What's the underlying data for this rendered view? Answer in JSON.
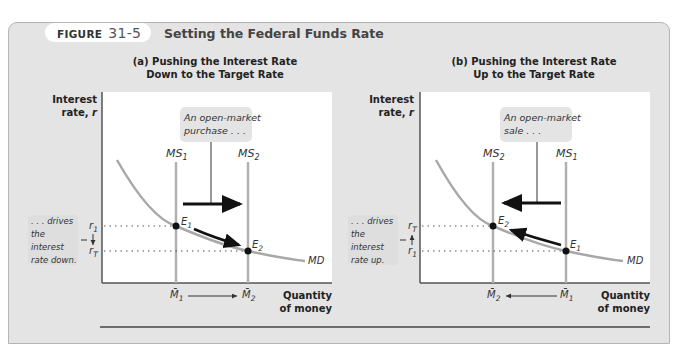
{
  "figure": {
    "label": "FIGURE",
    "number": "31-5",
    "title": "Setting the Federal Funds Rate"
  },
  "panels": [
    {
      "id": "a",
      "title_line1": "(a) Pushing the Interest Rate",
      "title_line2": "Down to the Target Rate",
      "y_axis_label_line1": "Interest",
      "y_axis_label_line2": "rate, r",
      "x_axis_label_line1": "Quantity",
      "x_axis_label_line2": "of money",
      "callout_line1": "An open-market",
      "callout_line2": "purchase . . .",
      "note_lines": [
        ". . . drives",
        "the",
        "interest",
        "rate down."
      ],
      "supply_left": "MS1",
      "supply_right": "MS2",
      "rate_top": "r1",
      "rate_bottom": "rT",
      "equilibrium_start": "E1",
      "equilibrium_end": "E2",
      "demand_label": "MD",
      "money_left": "M̄1",
      "money_right": "M̄2",
      "shift_direction": "right"
    },
    {
      "id": "b",
      "title_line1": "(b) Pushing the Interest Rate",
      "title_line2": "Up to the Target Rate",
      "y_axis_label_line1": "Interest",
      "y_axis_label_line2": "rate, r",
      "x_axis_label_line1": "Quantity",
      "x_axis_label_line2": "of money",
      "callout_line1": "An open-market",
      "callout_line2": "sale . . .",
      "note_lines": [
        ". . . drives",
        "the",
        "interest",
        "rate up."
      ],
      "supply_left": "MS2",
      "supply_right": "MS1",
      "rate_top": "rT",
      "rate_bottom": "r1",
      "equilibrium_start": "E1",
      "equilibrium_end": "E2",
      "demand_label": "MD",
      "money_left": "M̄2",
      "money_right": "M̄1",
      "shift_direction": "left"
    }
  ],
  "colors": {
    "panel_bg": "#e4e4e4",
    "plot_bg": "#ffffff",
    "curve": "#a8a8a8",
    "supply_line": "#b0b0b0",
    "callout_bg": "#e4e4e4",
    "arrow": "#111111"
  }
}
